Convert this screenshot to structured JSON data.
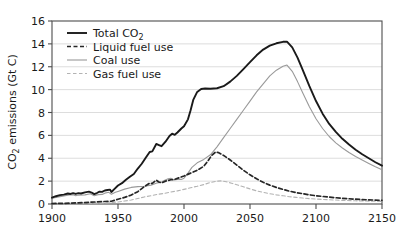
{
  "chart_data": {
    "type": "line",
    "title": "",
    "xlabel": "",
    "ylabel": "CO2 emissions (Gt C)",
    "ylabel_prefix": "CO",
    "ylabel_sub": "2",
    "ylabel_suffix": " emissions (Gt C)",
    "xlim": [
      1900,
      2150
    ],
    "ylim": [
      0,
      16
    ],
    "xticks": [
      1900,
      1950,
      2000,
      2050,
      2100,
      2150
    ],
    "yticks": [
      0,
      2,
      4,
      6,
      8,
      10,
      12,
      14,
      16
    ],
    "grid": "horizontal",
    "legend_position": "top-left",
    "series": [
      {
        "name": "Total CO2",
        "label_prefix": "Total CO",
        "label_sub": "2",
        "style": "solid",
        "color": "#1a1a1a",
        "width": 1.9,
        "points": [
          [
            1900,
            0.55
          ],
          [
            1903,
            0.68
          ],
          [
            1906,
            0.78
          ],
          [
            1909,
            0.82
          ],
          [
            1912,
            0.92
          ],
          [
            1914,
            0.88
          ],
          [
            1916,
            0.95
          ],
          [
            1918,
            0.88
          ],
          [
            1920,
            0.95
          ],
          [
            1922,
            0.92
          ],
          [
            1925,
            1.02
          ],
          [
            1928,
            1.08
          ],
          [
            1930,
            1.0
          ],
          [
            1932,
            0.86
          ],
          [
            1934,
            0.96
          ],
          [
            1936,
            1.08
          ],
          [
            1938,
            1.06
          ],
          [
            1940,
            1.18
          ],
          [
            1942,
            1.22
          ],
          [
            1944,
            1.26
          ],
          [
            1945,
            1.05
          ],
          [
            1947,
            1.28
          ],
          [
            1950,
            1.62
          ],
          [
            1953,
            1.82
          ],
          [
            1956,
            2.12
          ],
          [
            1959,
            2.38
          ],
          [
            1962,
            2.62
          ],
          [
            1965,
            3.1
          ],
          [
            1968,
            3.52
          ],
          [
            1971,
            4.05
          ],
          [
            1974,
            4.55
          ],
          [
            1976,
            4.6
          ],
          [
            1979,
            5.25
          ],
          [
            1981,
            5.15
          ],
          [
            1983,
            5.05
          ],
          [
            1986,
            5.45
          ],
          [
            1989,
            5.95
          ],
          [
            1991,
            6.15
          ],
          [
            1993,
            6.05
          ],
          [
            1995,
            6.25
          ],
          [
            1998,
            6.6
          ],
          [
            2000,
            6.8
          ],
          [
            2003,
            7.4
          ],
          [
            2005,
            8.2
          ],
          [
            2007,
            9.1
          ],
          [
            2010,
            9.8
          ],
          [
            2013,
            10.05
          ],
          [
            2016,
            10.1
          ],
          [
            2020,
            10.08
          ],
          [
            2025,
            10.12
          ],
          [
            2030,
            10.3
          ],
          [
            2035,
            10.7
          ],
          [
            2040,
            11.2
          ],
          [
            2045,
            11.8
          ],
          [
            2050,
            12.4
          ],
          [
            2055,
            13.0
          ],
          [
            2060,
            13.5
          ],
          [
            2065,
            13.85
          ],
          [
            2070,
            14.05
          ],
          [
            2075,
            14.18
          ],
          [
            2078,
            14.2
          ],
          [
            2082,
            13.7
          ],
          [
            2086,
            12.8
          ],
          [
            2090,
            11.7
          ],
          [
            2095,
            10.3
          ],
          [
            2100,
            9.0
          ],
          [
            2105,
            7.9
          ],
          [
            2110,
            7.0
          ],
          [
            2115,
            6.3
          ],
          [
            2120,
            5.7
          ],
          [
            2125,
            5.2
          ],
          [
            2130,
            4.75
          ],
          [
            2135,
            4.35
          ],
          [
            2140,
            4.0
          ],
          [
            2145,
            3.65
          ],
          [
            2150,
            3.35
          ]
        ]
      },
      {
        "name": "Liquid fuel use",
        "label": "Liquid fuel use",
        "style": "dashed",
        "color": "#262626",
        "width": 1.7,
        "dash": "4,2.5",
        "points": [
          [
            1900,
            0.04
          ],
          [
            1910,
            0.06
          ],
          [
            1920,
            0.1
          ],
          [
            1930,
            0.16
          ],
          [
            1940,
            0.22
          ],
          [
            1945,
            0.24
          ],
          [
            1950,
            0.42
          ],
          [
            1955,
            0.58
          ],
          [
            1960,
            0.78
          ],
          [
            1965,
            1.08
          ],
          [
            1970,
            1.52
          ],
          [
            1974,
            1.82
          ],
          [
            1976,
            1.8
          ],
          [
            1979,
            2.08
          ],
          [
            1981,
            1.92
          ],
          [
            1983,
            1.85
          ],
          [
            1986,
            2.0
          ],
          [
            1990,
            2.12
          ],
          [
            1993,
            2.15
          ],
          [
            1996,
            2.28
          ],
          [
            2000,
            2.45
          ],
          [
            2005,
            2.7
          ],
          [
            2010,
            2.95
          ],
          [
            2015,
            3.3
          ],
          [
            2018,
            3.75
          ],
          [
            2021,
            4.25
          ],
          [
            2024,
            4.55
          ],
          [
            2026,
            4.5
          ],
          [
            2030,
            4.25
          ],
          [
            2035,
            3.85
          ],
          [
            2040,
            3.4
          ],
          [
            2045,
            2.95
          ],
          [
            2050,
            2.55
          ],
          [
            2055,
            2.2
          ],
          [
            2060,
            1.9
          ],
          [
            2065,
            1.65
          ],
          [
            2070,
            1.45
          ],
          [
            2075,
            1.28
          ],
          [
            2080,
            1.12
          ],
          [
            2085,
            1.0
          ],
          [
            2090,
            0.9
          ],
          [
            2095,
            0.8
          ],
          [
            2100,
            0.72
          ],
          [
            2110,
            0.6
          ],
          [
            2120,
            0.5
          ],
          [
            2130,
            0.42
          ],
          [
            2140,
            0.36
          ],
          [
            2150,
            0.32
          ]
        ]
      },
      {
        "name": "Coal use",
        "label": "Coal use",
        "style": "solid",
        "color": "#9a9a9a",
        "width": 1.1,
        "points": [
          [
            1900,
            0.5
          ],
          [
            1905,
            0.62
          ],
          [
            1910,
            0.72
          ],
          [
            1913,
            0.8
          ],
          [
            1916,
            0.8
          ],
          [
            1918,
            0.72
          ],
          [
            1920,
            0.78
          ],
          [
            1925,
            0.8
          ],
          [
            1929,
            0.9
          ],
          [
            1932,
            0.72
          ],
          [
            1935,
            0.82
          ],
          [
            1938,
            0.84
          ],
          [
            1940,
            0.95
          ],
          [
            1943,
            1.02
          ],
          [
            1945,
            0.85
          ],
          [
            1948,
            1.02
          ],
          [
            1950,
            1.1
          ],
          [
            1955,
            1.3
          ],
          [
            1960,
            1.45
          ],
          [
            1965,
            1.52
          ],
          [
            1970,
            1.55
          ],
          [
            1975,
            1.65
          ],
          [
            1980,
            1.85
          ],
          [
            1983,
            1.92
          ],
          [
            1985,
            2.05
          ],
          [
            1988,
            2.2
          ],
          [
            1990,
            2.25
          ],
          [
            1992,
            2.1
          ],
          [
            1995,
            2.15
          ],
          [
            1998,
            2.15
          ],
          [
            2000,
            2.25
          ],
          [
            2003,
            2.7
          ],
          [
            2006,
            3.2
          ],
          [
            2010,
            3.6
          ],
          [
            2015,
            3.9
          ],
          [
            2020,
            4.3
          ],
          [
            2025,
            5.0
          ],
          [
            2030,
            5.8
          ],
          [
            2035,
            6.6
          ],
          [
            2040,
            7.4
          ],
          [
            2045,
            8.2
          ],
          [
            2050,
            9.0
          ],
          [
            2055,
            9.8
          ],
          [
            2060,
            10.5
          ],
          [
            2065,
            11.2
          ],
          [
            2070,
            11.7
          ],
          [
            2075,
            12.05
          ],
          [
            2078,
            12.15
          ],
          [
            2082,
            11.6
          ],
          [
            2086,
            10.7
          ],
          [
            2090,
            9.7
          ],
          [
            2095,
            8.5
          ],
          [
            2100,
            7.45
          ],
          [
            2105,
            6.6
          ],
          [
            2110,
            5.9
          ],
          [
            2115,
            5.35
          ],
          [
            2120,
            4.9
          ],
          [
            2125,
            4.5
          ],
          [
            2130,
            4.15
          ],
          [
            2135,
            3.85
          ],
          [
            2140,
            3.55
          ],
          [
            2145,
            3.25
          ],
          [
            2150,
            3.0
          ]
        ]
      },
      {
        "name": "Gas fuel use",
        "label": "Gas fuel use",
        "style": "dashed",
        "color": "#b3b3b3",
        "width": 1.1,
        "dash": "3.5,2.5",
        "points": [
          [
            1900,
            0.01
          ],
          [
            1920,
            0.03
          ],
          [
            1940,
            0.08
          ],
          [
            1950,
            0.18
          ],
          [
            1955,
            0.26
          ],
          [
            1960,
            0.35
          ],
          [
            1965,
            0.48
          ],
          [
            1970,
            0.62
          ],
          [
            1975,
            0.72
          ],
          [
            1980,
            0.85
          ],
          [
            1985,
            0.92
          ],
          [
            1990,
            1.05
          ],
          [
            1995,
            1.15
          ],
          [
            2000,
            1.28
          ],
          [
            2005,
            1.42
          ],
          [
            2010,
            1.55
          ],
          [
            2015,
            1.7
          ],
          [
            2020,
            1.88
          ],
          [
            2025,
            2.0
          ],
          [
            2028,
            2.02
          ],
          [
            2032,
            1.95
          ],
          [
            2036,
            1.82
          ],
          [
            2040,
            1.68
          ],
          [
            2045,
            1.5
          ],
          [
            2050,
            1.32
          ],
          [
            2055,
            1.15
          ],
          [
            2060,
            1.02
          ],
          [
            2065,
            0.9
          ],
          [
            2070,
            0.8
          ],
          [
            2075,
            0.72
          ],
          [
            2080,
            0.64
          ],
          [
            2085,
            0.58
          ],
          [
            2090,
            0.52
          ],
          [
            2095,
            0.47
          ],
          [
            2100,
            0.43
          ],
          [
            2110,
            0.37
          ],
          [
            2120,
            0.32
          ],
          [
            2130,
            0.28
          ],
          [
            2140,
            0.25
          ],
          [
            2150,
            0.22
          ]
        ]
      }
    ]
  }
}
